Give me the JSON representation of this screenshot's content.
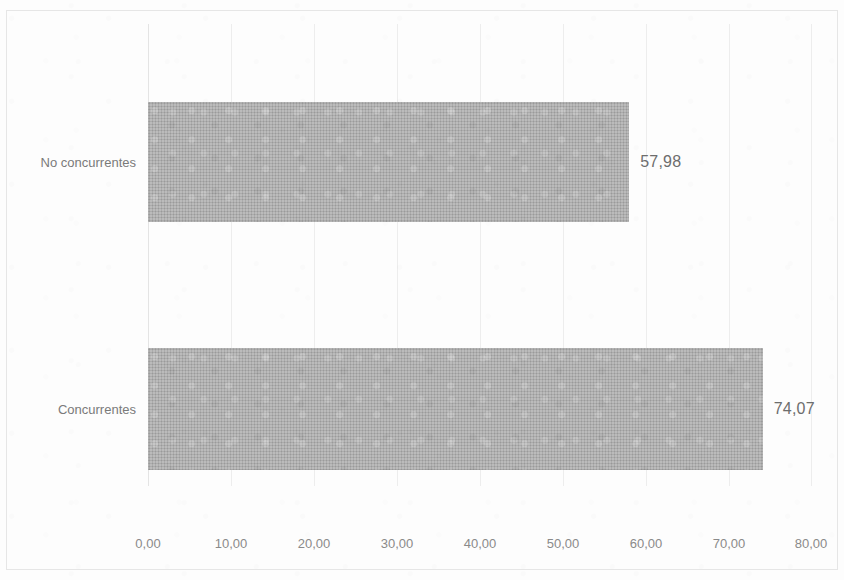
{
  "chart_data": {
    "type": "bar",
    "orientation": "horizontal",
    "title": "",
    "xlabel": "",
    "ylabel": "",
    "categories": [
      "No concurrentes",
      "Concurrentes"
    ],
    "values": [
      57.98,
      74.07
    ],
    "value_labels": [
      "57,98",
      "74,07"
    ],
    "xlim": [
      0,
      80
    ],
    "xticks": [
      0,
      10,
      20,
      30,
      40,
      50,
      60,
      70,
      80
    ],
    "xtick_labels": [
      "0,00",
      "10,00",
      "20,00",
      "30,00",
      "40,00",
      "50,00",
      "60,00",
      "70,00",
      "80,00"
    ],
    "grid": true,
    "grid_axis": "x",
    "legend": false,
    "decimal_separator": ",",
    "series": [
      {
        "name": "",
        "color": "#aaaaaa",
        "values": [
          57.98,
          74.07
        ]
      }
    ],
    "bars": [
      {
        "category": "No concurrentes",
        "value": 57.98,
        "label": "57,98",
        "color": "#aaaaaa"
      },
      {
        "category": "Concurrentes",
        "value": 74.07,
        "label": "74,07",
        "color": "#aaaaaa"
      }
    ],
    "colors": {
      "bar_fill": "#aaaaaa",
      "gridline": "#ededed",
      "axis_text": "#8a8a8a",
      "category_text": "#7a7a7a",
      "value_label_text": "#6d6d6d",
      "background": "#fdfdfd",
      "frame_border": "#e6e6e6"
    }
  }
}
